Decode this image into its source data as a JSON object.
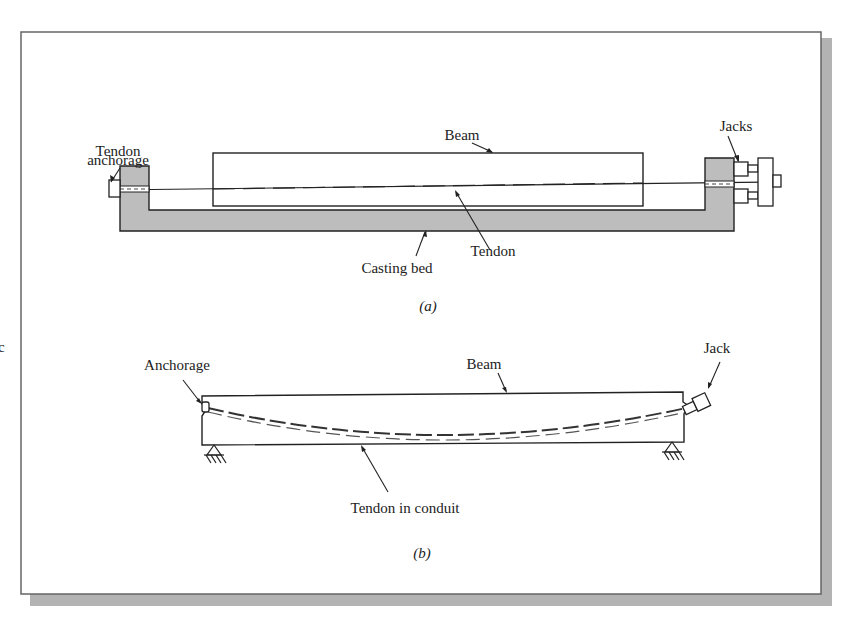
{
  "figure": {
    "margin_letter": "c",
    "shadow_color": "#b3b3b3",
    "bed_fill": "#bdbdbd",
    "line_color": "#222222"
  },
  "panel_a": {
    "caption": "(a)",
    "labels": {
      "tendon_anchorage_line1": "Tendon",
      "tendon_anchorage_line2": "anchorage",
      "beam": "Beam",
      "jacks": "Jacks",
      "tendon": "Tendon",
      "casting_bed": "Casting bed"
    }
  },
  "panel_b": {
    "caption": "(b)",
    "labels": {
      "anchorage": "Anchorage",
      "beam": "Beam",
      "jack": "Jack",
      "tendon_in_conduit": "Tendon in conduit"
    }
  }
}
